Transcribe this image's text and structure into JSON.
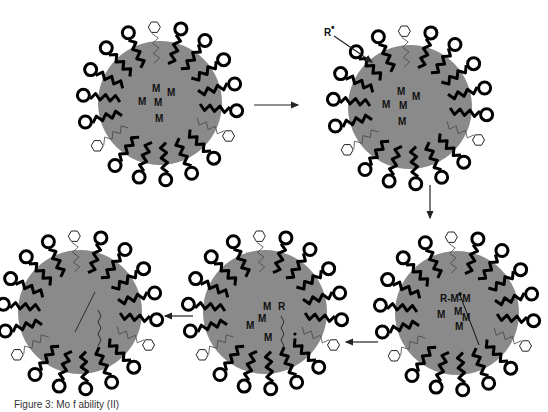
{
  "figure": {
    "caption": "Figure 3: Mo  f                        ability (II)",
    "colors": {
      "core": "#8a8a8a",
      "chain": "#000000",
      "background": "#ffffff"
    }
  },
  "stages": [
    {
      "id": 1,
      "cx": 160,
      "cy": 103,
      "labels": [
        {
          "t": "M",
          "x": 152,
          "y": 92
        },
        {
          "t": "M",
          "x": 167,
          "y": 96
        },
        {
          "t": "M",
          "x": 138,
          "y": 105
        },
        {
          "t": "M",
          "x": 154,
          "y": 106
        },
        {
          "t": "M",
          "x": 155,
          "y": 122
        }
      ]
    },
    {
      "id": 2,
      "cx": 410,
      "cy": 107,
      "labels": [
        {
          "t": "M",
          "x": 397,
          "y": 95
        },
        {
          "t": "M",
          "x": 412,
          "y": 100
        },
        {
          "t": "M",
          "x": 382,
          "y": 108
        },
        {
          "t": "M",
          "x": 399,
          "y": 109
        },
        {
          "t": "M",
          "x": 398,
          "y": 125
        }
      ]
    },
    {
      "id": 3,
      "cx": 457,
      "cy": 313,
      "labels": [
        {
          "t": "R-M-M",
          "x": 440,
          "y": 302
        },
        {
          "t": "M",
          "x": 437,
          "y": 318
        },
        {
          "t": "M",
          "x": 454,
          "y": 315
        },
        {
          "t": "M",
          "x": 462,
          "y": 321
        },
        {
          "t": "M",
          "x": 455,
          "y": 330
        }
      ]
    },
    {
      "id": 4,
      "cx": 265,
      "cy": 312,
      "labels": [
        {
          "t": "M",
          "x": 263,
          "y": 310
        },
        {
          "t": "R",
          "x": 278,
          "y": 310
        },
        {
          "t": "M",
          "x": 258,
          "y": 322
        },
        {
          "t": "M",
          "x": 246,
          "y": 329
        },
        {
          "t": "M",
          "x": 264,
          "y": 341
        }
      ]
    },
    {
      "id": 5,
      "cx": 80,
      "cy": 312,
      "labels": []
    }
  ],
  "annotations": {
    "radical_label": "R",
    "radical_superscript": "•"
  },
  "arrows": [
    {
      "from": "stage-1",
      "to": "stage-2",
      "x1": 254,
      "y1": 105,
      "x2": 298,
      "y2": 105
    },
    {
      "from": "stage-2",
      "to": "stage-3",
      "x1": 430,
      "y1": 185,
      "x2": 430,
      "y2": 218
    },
    {
      "from": "stage-3",
      "to": "stage-4",
      "x1": 378,
      "y1": 342,
      "x2": 346,
      "y2": 342
    },
    {
      "from": "stage-4",
      "to": "stage-5",
      "x1": 193,
      "y1": 316,
      "x2": 165,
      "y2": 316
    }
  ]
}
